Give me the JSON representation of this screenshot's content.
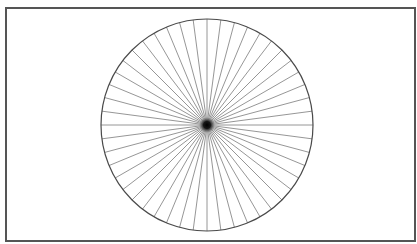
{
  "figure": {
    "type": "siemens-star",
    "frame": {
      "x": 5,
      "y": 7,
      "width": 409,
      "height": 233,
      "stroke": "#555555",
      "stroke_width": 2
    },
    "circle": {
      "cx": 207,
      "cy": 125,
      "r": 106,
      "stroke": "#4a4a4a",
      "stroke_width": 1.2
    },
    "spokes": {
      "count": 48,
      "stroke": "#8a8a8a",
      "stroke_width": 0.9,
      "start_angle_deg": 0
    },
    "center_dot": {
      "r": 5,
      "color": "#111111"
    },
    "colors": {
      "background": "#ffffff"
    }
  }
}
